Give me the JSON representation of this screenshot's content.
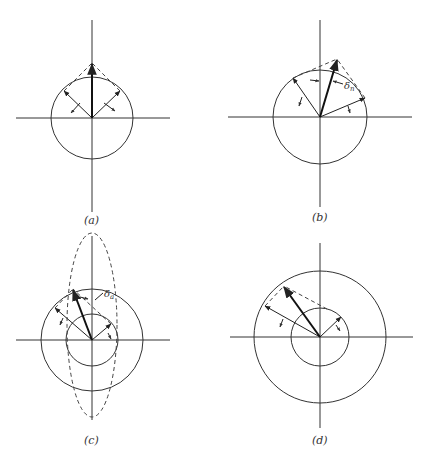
{
  "figure": {
    "panels": [
      {
        "id": "a",
        "label": "(a)",
        "description": "Two equal vectors on a circle combine into a vertical resultant along the axis"
      },
      {
        "id": "b",
        "label": "(b)",
        "description": "Unequal phase components produce resultant tilted by angle δn",
        "angle_label": "δn"
      },
      {
        "id": "c",
        "label": "(c)",
        "description": "Two concentric circles with dashed ellipse; resultant tilted by δa",
        "angle_label": "δa"
      },
      {
        "id": "d",
        "label": "(d)",
        "description": "Two concentric circles of different radii; resultant formed with dashed parallelogram"
      }
    ]
  },
  "labels": {
    "a": "(a)",
    "b": "(b)",
    "c": "(c)",
    "d": "(d)",
    "delta_n_main": "δ",
    "delta_n_sub": "n",
    "delta_a_main": "δ",
    "delta_a_sub": "a"
  }
}
